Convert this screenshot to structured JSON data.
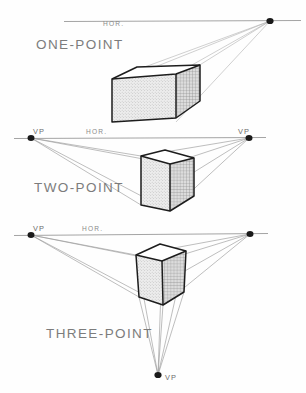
{
  "document": {
    "title": "Perspective Types Diagram",
    "background_color": "#fefefe",
    "ink_color": "#1d1d1d",
    "label_color": "#7c7c7c",
    "ray_color": "#9a9a9a"
  },
  "panels": [
    {
      "id": "one-point",
      "title": "ONE-POINT",
      "horizon_label": "HOR.",
      "vanishing_points": [
        {
          "label": "",
          "x": 270,
          "y": 21,
          "position": "right-on-horizon"
        }
      ],
      "horizon": {
        "y": 21,
        "x_start": 64,
        "x_end": 301
      },
      "solid": "rectangular-box",
      "faces": {
        "front": "light-stipple",
        "side": "cross-hatch",
        "top": "white"
      }
    },
    {
      "id": "two-point",
      "title": "TWO-POINT",
      "horizon_label": "HOR.",
      "vanishing_points": [
        {
          "label": "VP",
          "x": 31,
          "y": 138,
          "position": "left-on-horizon"
        },
        {
          "label": "VP",
          "x": 249,
          "y": 138,
          "position": "right-on-horizon"
        }
      ],
      "horizon": {
        "y": 138,
        "x_start": 14,
        "x_end": 266
      },
      "solid": "cube",
      "faces": {
        "front": "light-stipple",
        "side": "cross-hatch",
        "top": "white"
      }
    },
    {
      "id": "three-point",
      "title": "THREE-POINT",
      "horizon_label": "HOR.",
      "vanishing_points": [
        {
          "label": "VP",
          "x": 31,
          "y": 235,
          "position": "left-on-horizon"
        },
        {
          "label": "",
          "x": 250,
          "y": 234,
          "position": "right-on-horizon"
        },
        {
          "label": "VP",
          "x": 158,
          "y": 375,
          "position": "below"
        }
      ],
      "horizon": {
        "y": 234,
        "x_start": 14,
        "x_end": 268
      },
      "solid": "tapered-cube",
      "faces": {
        "front": "light-stipple",
        "side": "cross-hatch",
        "top": "white"
      }
    }
  ],
  "labels": {
    "vp_short": "VP",
    "horizon_short": "HOR."
  }
}
